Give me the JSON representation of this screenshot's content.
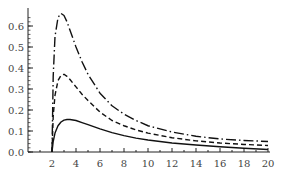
{
  "chart_data": {
    "type": "line",
    "title": "",
    "xlabel": "",
    "ylabel": "",
    "xlim": [
      0,
      20
    ],
    "ylim": [
      0,
      0.67
    ],
    "xticks": [
      "2",
      "4",
      "6",
      "8",
      "10",
      "12",
      "14",
      "16",
      "18",
      "20"
    ],
    "yticks": [
      "0.0",
      "0.1",
      "0.2",
      "0.3",
      "0.4",
      "0.5",
      "0.6"
    ],
    "grid": false,
    "legend": null,
    "x": [
      2,
      2.1,
      2.25,
      2.5,
      2.75,
      3,
      3.25,
      3.5,
      4,
      4.5,
      5,
      6,
      7,
      8,
      9,
      10,
      12,
      14,
      16,
      18,
      20
    ],
    "series": [
      {
        "name": "dash-dot",
        "style": "dashdot",
        "values": [
          0,
          0.36,
          0.55,
          0.64,
          0.66,
          0.65,
          0.62,
          0.58,
          0.5,
          0.43,
          0.37,
          0.28,
          0.22,
          0.18,
          0.15,
          0.125,
          0.095,
          0.075,
          0.062,
          0.055,
          0.05
        ]
      },
      {
        "name": "dashed",
        "style": "dashed",
        "values": [
          0,
          0.17,
          0.27,
          0.34,
          0.365,
          0.37,
          0.36,
          0.345,
          0.31,
          0.275,
          0.245,
          0.19,
          0.15,
          0.125,
          0.105,
          0.09,
          0.068,
          0.053,
          0.043,
          0.036,
          0.031
        ]
      },
      {
        "name": "solid",
        "style": "solid",
        "values": [
          0,
          0.05,
          0.09,
          0.125,
          0.143,
          0.152,
          0.155,
          0.155,
          0.15,
          0.14,
          0.13,
          0.11,
          0.092,
          0.078,
          0.066,
          0.057,
          0.043,
          0.033,
          0.025,
          0.018,
          0.012
        ]
      }
    ]
  }
}
